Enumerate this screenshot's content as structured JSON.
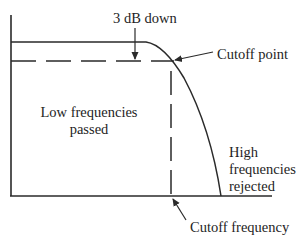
{
  "diagram": {
    "type": "low-pass filter frequency response",
    "labels": {
      "three_db": "3 dB down",
      "cutoff_point": "Cutoff point",
      "low_line1": "Low frequencies",
      "low_line2": "passed",
      "high_line1": "High",
      "high_line2": "frequencies",
      "high_line3": "rejected",
      "cutoff_frequency": "Cutoff frequency"
    },
    "colors": {
      "line": "#2a2a2a",
      "text": "#1e1e1e",
      "background": "#ffffff"
    }
  }
}
